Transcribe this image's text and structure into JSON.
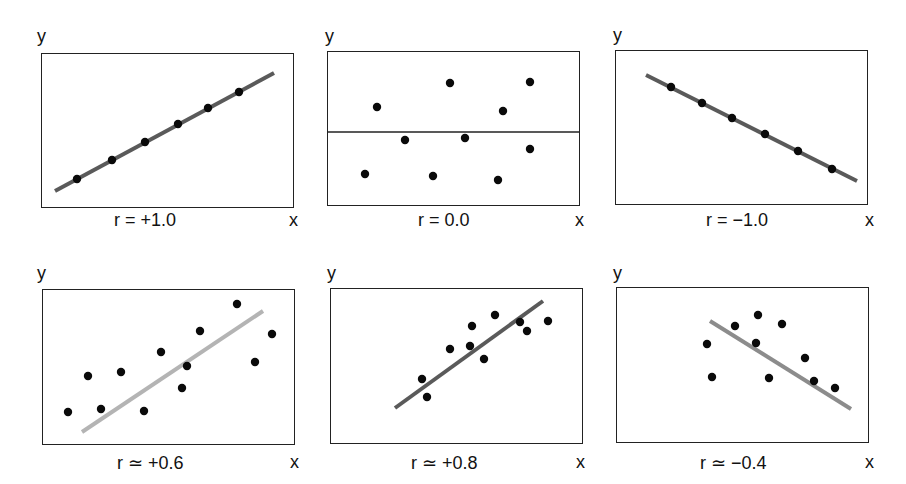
{
  "chart_data": [
    {
      "type": "scatter",
      "title": "",
      "label": "r = +1.0",
      "xlabel": "x",
      "ylabel": "y",
      "box": [
        41,
        53,
        253,
        155
      ],
      "fit_line": {
        "x1": 55,
        "y1": 191,
        "x2": 274,
        "y2": 73,
        "color": "#5a5a5a",
        "width": 4
      },
      "points": [
        [
          77,
          179
        ],
        [
          112,
          160
        ],
        [
          145,
          142
        ],
        [
          178,
          124
        ],
        [
          208,
          108
        ],
        [
          239,
          92
        ]
      ],
      "label_pos": [
        114,
        210
      ],
      "x_pos": [
        289,
        210
      ],
      "y_pos": [
        37,
        26
      ]
    },
    {
      "type": "scatter",
      "title": "",
      "label": "r = 0.0",
      "xlabel": "x",
      "ylabel": "y",
      "box": [
        327,
        51,
        253,
        155
      ],
      "fit_line": {
        "x1": 327,
        "y1": 132,
        "x2": 580,
        "y2": 132,
        "color": "#222222",
        "width": 1.5
      },
      "points": [
        [
          377,
          107
        ],
        [
          450,
          83
        ],
        [
          530,
          82
        ],
        [
          503,
          111
        ],
        [
          405,
          140
        ],
        [
          465,
          138
        ],
        [
          530,
          149
        ],
        [
          365,
          174
        ],
        [
          433,
          176
        ],
        [
          498,
          180
        ]
      ],
      "label_pos": [
        418,
        210
      ],
      "x_pos": [
        575,
        210
      ],
      "y_pos": [
        325,
        26
      ]
    },
    {
      "type": "scatter",
      "title": "",
      "label": "r = −1.0",
      "xlabel": "x",
      "ylabel": "y",
      "box": [
        615,
        50,
        253,
        155
      ],
      "fit_line": {
        "x1": 646,
        "y1": 75,
        "x2": 857,
        "y2": 181,
        "color": "#5a5a5a",
        "width": 4
      },
      "points": [
        [
          671,
          87
        ],
        [
          702,
          103
        ],
        [
          732,
          118
        ],
        [
          765,
          134
        ],
        [
          798,
          151
        ],
        [
          832,
          169
        ]
      ],
      "label_pos": [
        706,
        210
      ],
      "x_pos": [
        865,
        210
      ],
      "y_pos": [
        613,
        25
      ]
    },
    {
      "type": "scatter",
      "title": "",
      "label": "r ≃ +0.6",
      "xlabel": "x",
      "ylabel": "y",
      "box": [
        42,
        289,
        253,
        156
      ],
      "fit_line": {
        "x1": 82,
        "y1": 432,
        "x2": 263,
        "y2": 311,
        "color": "#b4b4b4",
        "width": 4
      },
      "points": [
        [
          68,
          412
        ],
        [
          88,
          376
        ],
        [
          101,
          409
        ],
        [
          121,
          372
        ],
        [
          144,
          411
        ],
        [
          161,
          352
        ],
        [
          182,
          388
        ],
        [
          187,
          366
        ],
        [
          200,
          331
        ],
        [
          237,
          304
        ],
        [
          255,
          362
        ],
        [
          272,
          334
        ]
      ],
      "label_pos": [
        117,
        452
      ],
      "x_pos": [
        290,
        452
      ],
      "y_pos": [
        37,
        263
      ]
    },
    {
      "type": "scatter",
      "title": "",
      "label": "r ≃ +0.8",
      "xlabel": "x",
      "ylabel": "y",
      "box": [
        330,
        288,
        253,
        156
      ],
      "fit_line": {
        "x1": 395,
        "y1": 408,
        "x2": 543,
        "y2": 301,
        "color": "#5a5a5a",
        "width": 4
      },
      "points": [
        [
          422,
          379
        ],
        [
          427,
          397
        ],
        [
          450,
          349
        ],
        [
          472,
          326
        ],
        [
          470,
          346
        ],
        [
          484,
          359
        ],
        [
          495,
          315
        ],
        [
          520,
          322
        ],
        [
          527,
          331
        ],
        [
          548,
          321
        ]
      ],
      "label_pos": [
        411,
        452
      ],
      "x_pos": [
        576,
        452
      ],
      "y_pos": [
        327,
        263
      ]
    },
    {
      "type": "scatter",
      "title": "",
      "label": "r ≃ −0.4",
      "xlabel": "x",
      "ylabel": "y",
      "box": [
        616,
        287,
        253,
        156
      ],
      "fit_line": {
        "x1": 710,
        "y1": 321,
        "x2": 851,
        "y2": 409,
        "color": "#8c8c8c",
        "width": 4
      },
      "points": [
        [
          707,
          344
        ],
        [
          712,
          377
        ],
        [
          735,
          326
        ],
        [
          758,
          315
        ],
        [
          756,
          343
        ],
        [
          769,
          378
        ],
        [
          782,
          324
        ],
        [
          805,
          358
        ],
        [
          814,
          381
        ],
        [
          835,
          388
        ]
      ],
      "label_pos": [
        700,
        452
      ],
      "x_pos": [
        865,
        452
      ],
      "y_pos": [
        613,
        263
      ]
    }
  ],
  "panels": [
    {
      "label": "r = +1.0",
      "x": "x",
      "y": "y"
    },
    {
      "label": "r = 0.0",
      "x": "x",
      "y": "y"
    },
    {
      "label": "r = −1.0",
      "x": "x",
      "y": "y"
    },
    {
      "label": "r ≃ +0.6",
      "x": "x",
      "y": "y"
    },
    {
      "label": "r ≃ +0.8",
      "x": "x",
      "y": "y"
    },
    {
      "label": "r ≃ −0.4",
      "x": "x",
      "y": "y"
    }
  ],
  "colors": {
    "dot": "#0a0a0a",
    "frame": "#222222"
  }
}
